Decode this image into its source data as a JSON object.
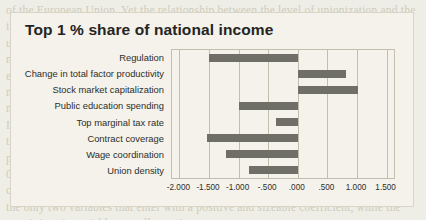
{
  "chart_data": {
    "type": "bar",
    "orientation": "horizontal",
    "title": "Top 1 % share of national income",
    "xlabel": "",
    "ylabel": "",
    "categories": [
      "Regulation",
      "Change in total factor productivity",
      "Stock market capitalization",
      "Public education spending",
      "Top marginal tax rate",
      "Contract coverage",
      "Wage coordination",
      "Union density"
    ],
    "values": [
      -1.5,
      0.81,
      1.02,
      -0.99,
      -0.37,
      -1.53,
      -1.21,
      -0.83
    ],
    "xlim": [
      -2.125,
      1.625
    ],
    "xticks": [
      -2.0,
      -1.5,
      -1.0,
      -0.5,
      0.0,
      0.5,
      1.0,
      1.5
    ],
    "xticklabels": [
      "-2.000",
      "-1.500",
      "-1.000",
      "-.500",
      ".000",
      ".500",
      "1.000",
      "1.500"
    ],
    "grid": "vertical",
    "legend": null,
    "bar_color": "#6f6f67",
    "plot_background": "#f4f2ea",
    "gridline_color": "#c3bfae"
  },
  "page": {
    "background_text": "of the European Union. Yet the relationship between the level of unionization and the\nincome share of the top 1 percent is strongly negative in the data, suggesting that\nunions do act as a counterweight to the bargaining power of top earners in wage\nnegotiations. The figure below reports standardized regression coefficients for eight\nexplanatory variables in a pooled panel of advanced economies, 1960 to 2010. Labor\nmarket institutions enter with negative signs, while financial and productivity\nmeasures enter positively.\nIt is worth noting that the size of the coefficient on union density is comparable to\nthat on top marginal tax rates, a variable that has received far more attention in the\npublic debate. A one standard deviation decline in union density is associated with a\n0.8 standard deviation increase in the top 1 percent share, holding other factors\nconstant. Stock market capitalization and the change in total factor productivity are\nthe only two variables that enter with a positive and sizeable coefficient, while the\nremaining six variables are all negative."
  }
}
